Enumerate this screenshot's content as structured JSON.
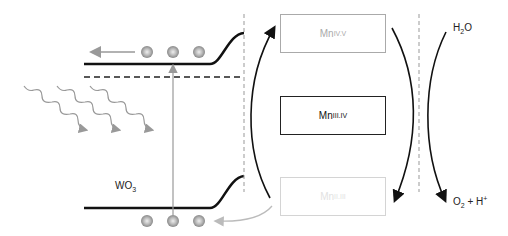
{
  "diagram": {
    "semiconductor": {
      "label": "WO",
      "label_sub": "3"
    },
    "mn_states": [
      {
        "base": "Mn",
        "sup": "IV.V",
        "state": "faded-gray"
      },
      {
        "base": "Mn",
        "sup": "III.IV",
        "state": "active"
      },
      {
        "base": "Mn",
        "sup": "II.III",
        "state": "very-faded"
      }
    ],
    "water": {
      "reactant_base": "H",
      "reactant_sub": "2",
      "reactant_tail": "O",
      "product_base": "O",
      "product_sub": "2",
      "product_tail": " + H",
      "product_sup": "+"
    },
    "colors": {
      "line": "#111111",
      "gray": "#999999",
      "light": "#cfcfcf",
      "dash": "#888888"
    }
  }
}
